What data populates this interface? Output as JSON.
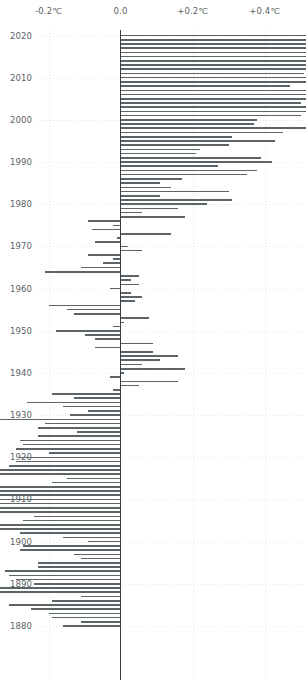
{
  "chart_data": {
    "type": "bar",
    "orientation": "horizontal",
    "title": "",
    "xlabel": "",
    "ylabel": "",
    "xlim": [
      -0.55,
      0.95
    ],
    "ylim": [
      1879,
      2021
    ],
    "grid": true,
    "legend": null,
    "bar_color": "#5d6468",
    "axis_color": "#3b3f43",
    "grid_color": "#e4e8ec",
    "background": "#ffffff",
    "xtick_labels": [
      "-0.4℃",
      "-0.2℃",
      "0.0",
      "+0.2℃",
      "+0.4℃",
      "+0.6℃",
      "+0.8℃"
    ],
    "xtick_values": [
      -0.4,
      -0.2,
      0.0,
      0.2,
      0.4,
      0.6,
      0.8
    ],
    "ytick_labels": [
      "2020",
      "2010",
      "2000",
      "1990",
      "1980",
      "1970",
      "1960",
      "1950",
      "1940",
      "1930",
      "1920",
      "1910",
      "1900",
      "1890",
      "1880"
    ],
    "ytick_values": [
      2020,
      2010,
      2000,
      1990,
      1980,
      1970,
      1960,
      1950,
      1940,
      1930,
      1920,
      1910,
      1900,
      1890,
      1880
    ],
    "categories": [
      2020,
      2019,
      2018,
      2017,
      2016,
      2015,
      2014,
      2013,
      2012,
      2011,
      2010,
      2009,
      2008,
      2007,
      2006,
      2005,
      2004,
      2003,
      2002,
      2001,
      2000,
      1999,
      1998,
      1997,
      1996,
      1995,
      1994,
      1993,
      1992,
      1991,
      1990,
      1989,
      1988,
      1987,
      1986,
      1985,
      1984,
      1983,
      1982,
      1981,
      1980,
      1979,
      1978,
      1977,
      1976,
      1975,
      1974,
      1973,
      1972,
      1971,
      1970,
      1969,
      1968,
      1967,
      1966,
      1965,
      1964,
      1963,
      1962,
      1961,
      1960,
      1959,
      1958,
      1957,
      1956,
      1955,
      1954,
      1953,
      1952,
      1951,
      1950,
      1949,
      1948,
      1947,
      1946,
      1945,
      1944,
      1943,
      1942,
      1941,
      1940,
      1939,
      1938,
      1937,
      1936,
      1935,
      1934,
      1933,
      1932,
      1931,
      1930,
      1929,
      1928,
      1927,
      1926,
      1925,
      1924,
      1923,
      1922,
      1921,
      1920,
      1919,
      1918,
      1917,
      1916,
      1915,
      1914,
      1913,
      1912,
      1911,
      1910,
      1909,
      1908,
      1907,
      1906,
      1905,
      1904,
      1903,
      1902,
      1901,
      1900,
      1899,
      1898,
      1897,
      1896,
      1895,
      1894,
      1893,
      1892,
      1891,
      1890,
      1889,
      1888,
      1887,
      1886,
      1885,
      1884,
      1883,
      1882,
      1881,
      1880
    ],
    "values": [
      0.84,
      0.76,
      0.68,
      0.75,
      0.87,
      0.76,
      0.61,
      0.58,
      0.55,
      0.51,
      0.63,
      0.57,
      0.47,
      0.59,
      0.55,
      0.65,
      0.5,
      0.59,
      0.59,
      0.5,
      0.38,
      0.37,
      0.6,
      0.45,
      0.31,
      0.43,
      0.3,
      0.22,
      0.21,
      0.39,
      0.42,
      0.27,
      0.38,
      0.35,
      0.17,
      0.11,
      0.14,
      0.3,
      0.11,
      0.31,
      0.24,
      0.16,
      0.06,
      0.18,
      -0.09,
      -0.02,
      -0.08,
      0.14,
      -0.01,
      -0.07,
      0.02,
      0.06,
      -0.09,
      -0.02,
      -0.05,
      -0.11,
      -0.21,
      0.05,
      0.03,
      0.05,
      -0.03,
      0.03,
      0.06,
      0.04,
      -0.2,
      -0.15,
      -0.13,
      0.08,
      0.01,
      -0.02,
      -0.18,
      -0.1,
      -0.07,
      0.09,
      -0.07,
      0.09,
      0.16,
      0.11,
      0.06,
      0.18,
      0.01,
      -0.03,
      0.16,
      0.05,
      -0.02,
      -0.19,
      -0.13,
      -0.26,
      -0.16,
      -0.09,
      -0.14,
      -0.38,
      -0.21,
      -0.23,
      -0.12,
      -0.23,
      -0.28,
      -0.27,
      -0.29,
      -0.2,
      -0.28,
      -0.29,
      -0.31,
      -0.47,
      -0.38,
      -0.15,
      -0.19,
      -0.36,
      -0.39,
      -0.48,
      -0.44,
      -0.49,
      -0.44,
      -0.39,
      -0.24,
      -0.27,
      -0.39,
      -0.38,
      -0.28,
      -0.16,
      -0.09,
      -0.27,
      -0.28,
      -0.13,
      -0.11,
      -0.23,
      -0.23,
      -0.32,
      -0.31,
      -0.29,
      -0.24,
      -0.39,
      -0.44,
      -0.11,
      -0.19,
      -0.31,
      -0.25,
      -0.2,
      -0.19,
      -0.11,
      -0.16
    ]
  }
}
